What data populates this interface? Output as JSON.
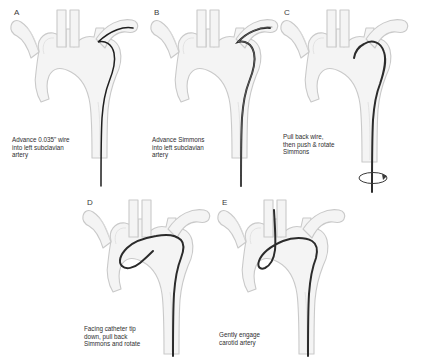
{
  "figure": {
    "background_color": "#ffffff",
    "vessel_fill": "#f4f4f4",
    "vessel_stroke": "#c9c9c9",
    "vessel_inner_stroke": "#dcdcdc",
    "catheter_color": "#2b2b2b",
    "wire_color": "#1f1f1f",
    "label_color": "#3a3a3a",
    "caption_color": "#2e2e2e",
    "layout": {
      "rows": 2,
      "top_row_panels": 3,
      "bottom_row_panels": 2
    }
  },
  "panels": [
    {
      "letter": "A",
      "caption": "Advance 0.035\" wire\ninto left subclavian\nartery",
      "device": "wire",
      "device_label": "0.035\" guidewire",
      "target_vessel": "left subclavian artery",
      "rotation_arrow": false,
      "x": 8,
      "y": 6,
      "letter_x": 14,
      "letter_y": 8,
      "caption_x": 12,
      "caption_y": 136
    },
    {
      "letter": "B",
      "caption": "Advance Simmons\ninto left subclavian\nartery",
      "device": "catheter",
      "device_label": "Simmons catheter",
      "target_vessel": "left subclavian artery",
      "rotation_arrow": false,
      "x": 148,
      "y": 6,
      "letter_x": 154,
      "letter_y": 8,
      "caption_x": 152,
      "caption_y": 136
    },
    {
      "letter": "C",
      "caption": "Pull back wire,\nthen  push & rotate\nSimmons",
      "device": "catheter",
      "device_label": "Simmons catheter",
      "target_vessel": "left subclavian artery",
      "rotation_arrow": true,
      "x": 278,
      "y": 6,
      "letter_x": 284,
      "letter_y": 8,
      "caption_x": 283,
      "caption_y": 133
    },
    {
      "letter": "D",
      "caption": "Facing catheter tip\ndown, pull back\nSimmons and rotate",
      "device": "catheter-reformed",
      "device_label": "Simmons catheter reformed",
      "target_vessel": "aortic arch",
      "rotation_arrow": false,
      "x": 80,
      "y": 196,
      "letter_x": 87,
      "letter_y": 198,
      "caption_x": 84,
      "caption_y": 325
    },
    {
      "letter": "E",
      "caption": "Gently engage\ncarotid artery",
      "device": "catheter-engaged",
      "device_label": "Simmons catheter engaged",
      "target_vessel": "left common carotid artery",
      "rotation_arrow": false,
      "x": 215,
      "y": 196,
      "letter_x": 222,
      "letter_y": 198,
      "caption_x": 219,
      "caption_y": 331
    }
  ]
}
